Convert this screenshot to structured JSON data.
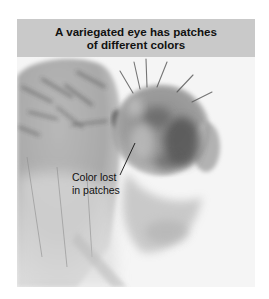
{
  "figure": {
    "title_lines": [
      "A variegated eye has patches",
      "of different colors"
    ],
    "annotation": {
      "lines": [
        "Color lost",
        "in patches"
      ]
    },
    "photo": {
      "subject": "fruit-fly-head-with-variegated-eye",
      "tone": "grayscale"
    },
    "colors": {
      "header_band": "#c9c9c9",
      "title_text": "#111111",
      "photo_background": "#f4f4f4"
    }
  }
}
